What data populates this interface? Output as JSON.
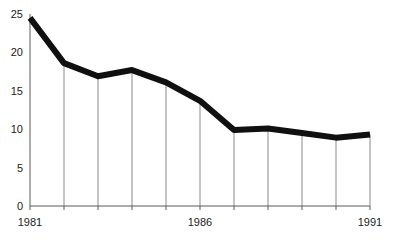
{
  "chart_data": {
    "type": "line",
    "title": "",
    "subtitle": "",
    "xlabel": "",
    "ylabel": "",
    "x": [
      1981,
      1982,
      1983,
      1984,
      1985,
      1986,
      1987,
      1988,
      1989,
      1990,
      1991
    ],
    "categories": [
      "1981",
      "1982",
      "1983",
      "1984",
      "1985",
      "1986",
      "1987",
      "1988",
      "1989",
      "1990",
      "1991"
    ],
    "values": [
      24.5,
      18.6,
      16.9,
      17.7,
      16.1,
      13.7,
      9.9,
      10.1,
      9.5,
      8.9,
      9.3
    ],
    "series": [
      {
        "name": "",
        "values": [
          24.5,
          18.6,
          16.9,
          17.7,
          16.1,
          13.7,
          9.9,
          10.1,
          9.5,
          8.9,
          9.3
        ]
      }
    ],
    "xlim": [
      1981,
      1991
    ],
    "ylim": [
      0,
      25
    ],
    "y_ticks": [
      0,
      5,
      10,
      15,
      20,
      25
    ],
    "y_tick_labels": [
      "0",
      "5",
      "10",
      "15",
      "20",
      "25"
    ],
    "x_tick_labels_shown": [
      "1981",
      "1986",
      "1991"
    ],
    "x_gridline_years": [
      1981,
      1982,
      1983,
      1984,
      1985,
      1986,
      1987,
      1988,
      1989,
      1990,
      1991
    ],
    "grid": "vertical-only",
    "legend": "none",
    "line_color": "#101010",
    "gridline_color": "#8a8a8a",
    "axis_color": "#5a5a5a",
    "background_color": "#ffffff"
  },
  "axes": {
    "y_labels": [
      {
        "text": "25",
        "value": 25
      },
      {
        "text": "20",
        "value": 20
      },
      {
        "text": "15",
        "value": 15
      },
      {
        "text": "10",
        "value": 10
      },
      {
        "text": "5",
        "value": 5
      },
      {
        "text": "0",
        "value": 0
      }
    ],
    "x_labels": [
      {
        "text": "1981",
        "value": 1981
      },
      {
        "text": "1986",
        "value": 1986
      },
      {
        "text": "1991",
        "value": 1991
      }
    ]
  }
}
